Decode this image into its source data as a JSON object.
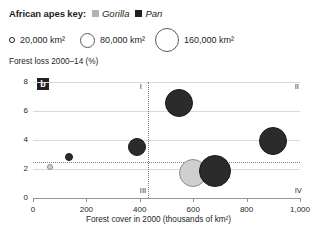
{
  "key": {
    "title": "African apes key:",
    "items": [
      {
        "label": "Gorilla",
        "color": "#b3b3b3",
        "icon": "square-swatch-gorilla"
      },
      {
        "label": "Pan",
        "color": "#231f20",
        "icon": "square-swatch-pan"
      }
    ]
  },
  "size_key": [
    {
      "label": "20,000 km²",
      "diameter_px": 4,
      "left_px": 0
    },
    {
      "label": "80,000 km²",
      "diameter_px": 13,
      "left_px": 71
    },
    {
      "label": "160,000 km²",
      "diameter_px": 22,
      "left_px": 146
    }
  ],
  "panel_tag": "b",
  "chart_data": {
    "type": "scatter",
    "title": "",
    "xlabel": "Forest cover in 2000 (thousands of km²)",
    "ylabel": "Forest loss 2000–14 (%)",
    "xlim": [
      0,
      1000
    ],
    "ylim": [
      0,
      8
    ],
    "xticks": [
      0,
      200,
      400,
      600,
      800,
      1000
    ],
    "xticklabels": [
      "0",
      "200",
      "400",
      "600",
      "800",
      "1,000"
    ],
    "yticks": [
      0,
      2,
      4,
      6,
      8
    ],
    "yticklabels": [
      "0",
      "2",
      "4",
      "6",
      "8"
    ],
    "grid": "horizontal",
    "legend_position": "top",
    "quadrant_divider_x": 430,
    "quadrant_divider_y": 2.45,
    "quadrant_labels": [
      {
        "text": "I",
        "x": 400,
        "y": 7.75
      },
      {
        "text": "II",
        "x": 980,
        "y": 7.75
      },
      {
        "text": "III",
        "x": 400,
        "y": 0.55
      },
      {
        "text": "IV",
        "x": 980,
        "y": 0.55
      }
    ],
    "series": [
      {
        "name": "Gorilla",
        "color": "#cfcfcf",
        "points": [
          {
            "x": 65,
            "y": 2.15,
            "size_km2": 20000,
            "r_px": 3
          },
          {
            "x": 600,
            "y": 1.75,
            "size_km2": 110000,
            "r_px": 14
          }
        ]
      },
      {
        "name": "Pan",
        "color": "#2b2b2b",
        "points": [
          {
            "x": 135,
            "y": 2.85,
            "size_km2": 24000,
            "r_px": 4
          },
          {
            "x": 390,
            "y": 3.55,
            "size_km2": 60000,
            "r_px": 9
          },
          {
            "x": 545,
            "y": 6.55,
            "size_km2": 150000,
            "r_px": 14
          },
          {
            "x": 680,
            "y": 1.85,
            "size_km2": 165000,
            "r_px": 16
          },
          {
            "x": 900,
            "y": 3.95,
            "size_km2": 150000,
            "r_px": 14
          }
        ]
      }
    ]
  }
}
